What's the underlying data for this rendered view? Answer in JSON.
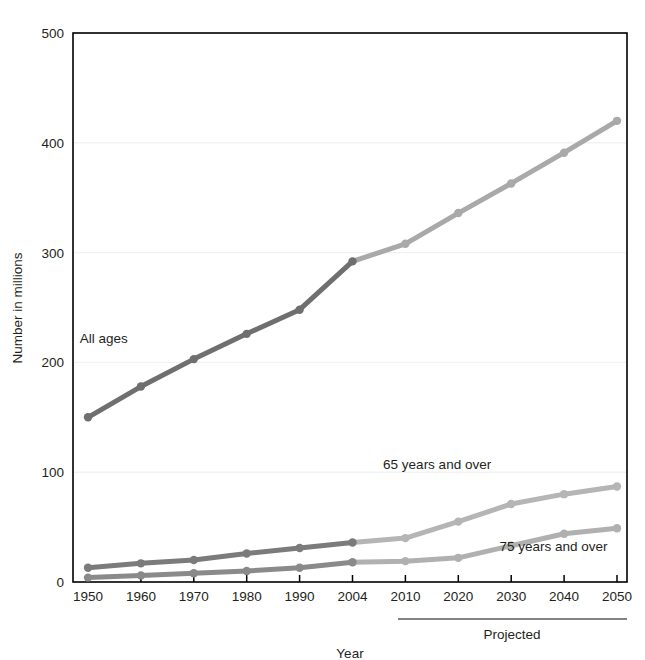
{
  "chart_data": {
    "type": "line",
    "title": "",
    "xlabel": "Year",
    "ylabel": "Number in millions",
    "categories": [
      "1950",
      "1960",
      "1970",
      "1980",
      "1990",
      "2004",
      "2010",
      "2020",
      "2030",
      "2040",
      "2050"
    ],
    "x_tick_labels": [
      "1950",
      "1960",
      "1970",
      "1980",
      "1990",
      "2004",
      "2010",
      "2020",
      "2030",
      "2040",
      "2050"
    ],
    "y_tick_labels": [
      "0",
      "100",
      "200",
      "300",
      "400",
      "500"
    ],
    "y_ticks": [
      0,
      100,
      200,
      300,
      400,
      500
    ],
    "ylim": [
      0,
      500
    ],
    "grid": true,
    "legend_position": "inline-annotations",
    "projected_note": "Projected",
    "projected_from": "2010",
    "series": [
      {
        "name": "All ages",
        "label": "All ages",
        "color_historical": "#6f6f6f",
        "color_projected": "#a9a9a9",
        "values": [
          150,
          178,
          203,
          226,
          248,
          292,
          308,
          336,
          363,
          391,
          420
        ]
      },
      {
        "name": "65 years and over",
        "label": "65 years and over",
        "color_historical": "#7b7b7b",
        "color_projected": "#b5b5b5",
        "values": [
          13,
          17,
          20,
          26,
          31,
          36,
          40,
          55,
          71,
          80,
          87
        ]
      },
      {
        "name": "75 years and over",
        "label": "75 years and over",
        "color_historical": "#8a8a8a",
        "color_projected": "#b0b0b0",
        "values": [
          4,
          6,
          8,
          10,
          13,
          18,
          19,
          22,
          33,
          44,
          49
        ]
      }
    ],
    "annotations": [
      {
        "text": "All ages",
        "x": 1953,
        "y": 218
      },
      {
        "text": "65 years and over",
        "x": 2016,
        "y": 103
      },
      {
        "text": "75 years and over",
        "x": 2038,
        "y": 28
      }
    ],
    "colors": {
      "historical_all_ages": "#6f6f6f",
      "projected_all_ages": "#a9a9a9",
      "series_65_projected": "#b5b5b5",
      "series_75_projected": "#b0b0b0",
      "axis": "#000000",
      "gridline": "#f2f2f4",
      "text": "#231f20"
    }
  },
  "artifacts": {
    "top_edge_text": "",
    "bottom_edge_text": ""
  }
}
